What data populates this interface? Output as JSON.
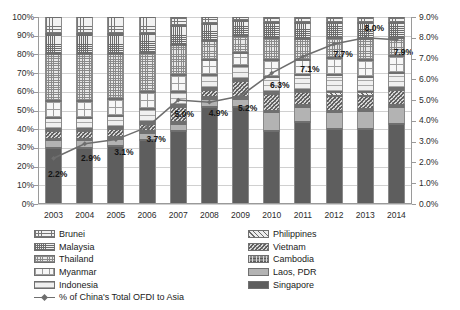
{
  "chart_data": {
    "type": "bar",
    "title": "",
    "subtitle": "",
    "xlabel": "",
    "ylabel": "",
    "y2label": "",
    "categories": [
      "2003",
      "2004",
      "2005",
      "2006",
      "2007",
      "2008",
      "2009",
      "2010",
      "2011",
      "2012",
      "2013",
      "2014"
    ],
    "stacked": true,
    "stack_mode": "100% stacked",
    "grid": true,
    "legend_position": "bottom",
    "yaxis_left": {
      "min": 0,
      "max": 100,
      "step": 10,
      "ticks": [
        "0%",
        "10%",
        "20%",
        "30%",
        "40%",
        "50%",
        "60%",
        "70%",
        "80%",
        "90%",
        "100%"
      ]
    },
    "yaxis_right": {
      "min": 0,
      "max": 9,
      "step": 1,
      "ticks": [
        "0.0%",
        "1.0%",
        "2.0%",
        "3.0%",
        "4.0%",
        "5.0%",
        "6.0%",
        "7.0%",
        "8.0%",
        "9.0%"
      ]
    },
    "series": [
      {
        "name": "Singapore",
        "axis": "left",
        "pattern": "solid-dark",
        "values": [
          30.0,
          30.0,
          31.0,
          34.0,
          39.0,
          52.0,
          52.0,
          39.0,
          44.0,
          40.0,
          40.0,
          43.0
        ]
      },
      {
        "name": "Laos, PDR",
        "axis": "left",
        "pattern": "solid-gray",
        "values": [
          4.0,
          4.0,
          4.0,
          4.0,
          4.0,
          4.0,
          4.0,
          10.0,
          8.0,
          9.0,
          10.0,
          9.0
        ]
      },
      {
        "name": "Cambodia",
        "axis": "left",
        "pattern": "mottled-dark",
        "values": [
          1.0,
          1.0,
          1.0,
          1.0,
          1.0,
          1.0,
          1.0,
          1.0,
          1.0,
          1.0,
          1.0,
          1.0
        ]
      },
      {
        "name": "Vietnam",
        "axis": "left",
        "pattern": "cross-diagonal",
        "values": [
          4.0,
          4.0,
          4.0,
          4.0,
          8.0,
          4.0,
          9.0,
          9.0,
          7.0,
          8.0,
          7.0,
          8.0
        ]
      },
      {
        "name": "Philippines",
        "axis": "left",
        "pattern": "diagonal-hatch",
        "values": [
          1.0,
          1.0,
          1.0,
          1.0,
          1.0,
          1.0,
          1.0,
          1.0,
          1.0,
          2.0,
          2.0,
          1.0
        ]
      },
      {
        "name": "Indonesia",
        "axis": "left",
        "pattern": "horizontal-fine",
        "values": [
          6.0,
          6.0,
          6.0,
          7.0,
          7.0,
          7.0,
          7.0,
          8.0,
          8.0,
          9.0,
          8.0,
          8.0
        ]
      },
      {
        "name": "Myanmar",
        "axis": "left",
        "pattern": "sparse-grid",
        "values": [
          9.0,
          9.0,
          9.0,
          9.0,
          9.0,
          8.0,
          7.0,
          9.0,
          8.0,
          9.0,
          9.0,
          9.0
        ]
      },
      {
        "name": "Thailand",
        "axis": "left",
        "pattern": "dense-checker",
        "values": [
          25.0,
          25.0,
          24.0,
          21.0,
          16.0,
          10.0,
          9.0,
          12.0,
          11.0,
          11.0,
          11.0,
          10.0
        ]
      },
      {
        "name": "Malaysia",
        "axis": "left",
        "pattern": "fine-grid",
        "values": [
          11.0,
          11.0,
          11.0,
          10.0,
          10.0,
          9.0,
          8.0,
          8.0,
          9.0,
          8.0,
          9.0,
          8.0
        ]
      },
      {
        "name": "Brunei",
        "axis": "left",
        "pattern": "coarse-grid",
        "values": [
          9.0,
          9.0,
          9.0,
          9.0,
          5.0,
          4.0,
          2.0,
          3.0,
          3.0,
          3.0,
          3.0,
          3.0
        ]
      }
    ],
    "line_series": {
      "name": "% of China's Total OFDI to Asia",
      "axis": "right",
      "marker": "diamond",
      "color": "#6e6e6e",
      "values": [
        2.2,
        2.9,
        3.1,
        3.7,
        5.0,
        4.9,
        5.2,
        6.3,
        7.1,
        7.7,
        8.0,
        7.9
      ],
      "data_labels": [
        "2.2%",
        "2.9%",
        "3.1%",
        "3.7%",
        "5.0%",
        "4.9%",
        "5.2%",
        "6.3%",
        "7.1%",
        "7.7%",
        "8.0%",
        "7.9%"
      ]
    }
  },
  "legend": {
    "left_column": [
      {
        "label": "Brunei",
        "pattern": "coarse-grid"
      },
      {
        "label": "Malaysia",
        "pattern": "fine-grid"
      },
      {
        "label": "Thailand",
        "pattern": "dense-checker"
      },
      {
        "label": "Myanmar",
        "pattern": "sparse-grid"
      },
      {
        "label": "Indonesia",
        "pattern": "horizontal-fine"
      },
      {
        "label": "% of China's Total OFDI to Asia",
        "pattern": "line-marker"
      }
    ],
    "right_column": [
      {
        "label": "Philippines",
        "pattern": "diagonal-hatch"
      },
      {
        "label": "Vietnam",
        "pattern": "cross-diagonal"
      },
      {
        "label": "Cambodia",
        "pattern": "mottled-dark"
      },
      {
        "label": "Laos, PDR",
        "pattern": "solid-gray"
      },
      {
        "label": "Singapore",
        "pattern": "solid-dark"
      }
    ]
  },
  "colors": {
    "line": "#6e6e6e",
    "grid": "#d0d0d0",
    "axis": "#9a9a9a",
    "singapore": "#5e5e5e",
    "laos": "#b3b3b3",
    "cambodia": "#8d8d8d"
  }
}
